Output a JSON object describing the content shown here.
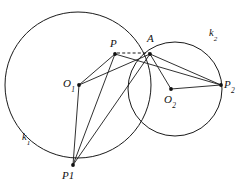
{
  "figure": {
    "background_color": "#ffffff",
    "stroke_color": "#1a1a1a",
    "width": 241,
    "height": 188
  },
  "circles": [
    {
      "name": "k1",
      "label": "k",
      "label_subscript": "1",
      "center_point": "O1",
      "cx": 78,
      "cy": 85,
      "r": 73
    },
    {
      "name": "k2",
      "label": "k",
      "label_subscript": "2",
      "center_point": "O2",
      "cx": 175,
      "cy": 89,
      "r": 47
    }
  ],
  "points": [
    {
      "id": "P",
      "label": "P",
      "subscript": "",
      "x": 115,
      "y": 54,
      "dot": true
    },
    {
      "id": "A",
      "label": "A",
      "subscript": "",
      "x": 150,
      "y": 54,
      "dot": true
    },
    {
      "id": "O1",
      "label": "O",
      "subscript": "1",
      "x": 79,
      "y": 85,
      "dot": true
    },
    {
      "id": "O2",
      "label": "O",
      "subscript": "2",
      "x": 171,
      "y": 89,
      "dot": true
    },
    {
      "id": "P2",
      "label": "P",
      "subscript": "2",
      "x": 221,
      "y": 85,
      "dot": true
    },
    {
      "id": "P1",
      "label": "P1",
      "subscript": "",
      "x": 73,
      "y": 165,
      "dot": true
    }
  ],
  "segments": [
    {
      "from": "O1",
      "to": "P",
      "style": "solid"
    },
    {
      "from": "O1",
      "to": "A",
      "style": "solid"
    },
    {
      "from": "O1",
      "to": "P1",
      "style": "solid"
    },
    {
      "from": "P",
      "to": "P1",
      "style": "solid"
    },
    {
      "from": "A",
      "to": "P1",
      "style": "solid"
    },
    {
      "from": "P",
      "to": "A",
      "style": "dashed"
    },
    {
      "from": "A",
      "to": "O2",
      "style": "solid"
    },
    {
      "from": "A",
      "to": "P2",
      "style": "solid"
    },
    {
      "from": "O2",
      "to": "P2",
      "style": "solid"
    },
    {
      "from": "P",
      "to": "P2",
      "style": "solid"
    }
  ],
  "labels": {
    "P": "P",
    "A": "A",
    "O1_base": "O",
    "O1_sub": "1",
    "O2_base": "O",
    "O2_sub": "2",
    "P2_base": "P",
    "P2_sub": "2",
    "P1": "P1",
    "k1_base": "k",
    "k1_sub": "1",
    "k2_base": "k",
    "k2_sub": "2"
  }
}
